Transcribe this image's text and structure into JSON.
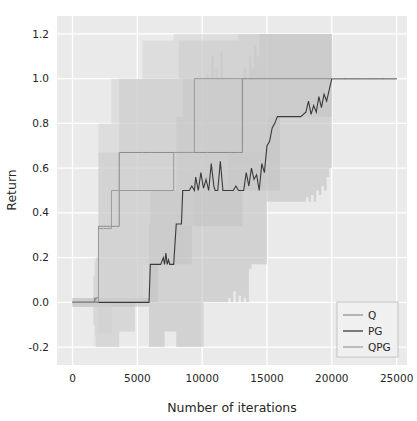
{
  "chart_data": {
    "type": "line",
    "title": "",
    "subtitle": "",
    "xlabel": "Number of iterations",
    "ylabel": "Return",
    "xlim": [
      -1200,
      25800
    ],
    "ylim": [
      -0.28,
      1.28
    ],
    "xticks": [
      0,
      5000,
      10000,
      15000,
      20000,
      25000
    ],
    "xtick_labels": [
      "0",
      "5000",
      "10000",
      "15000",
      "20000",
      "25000"
    ],
    "yticks": [
      -0.2,
      0.0,
      0.2,
      0.4,
      0.6,
      0.8,
      1.0,
      1.2
    ],
    "ytick_labels": [
      "-0.2",
      "0.0",
      "0.2",
      "0.4",
      "0.6",
      "0.8",
      "1.0",
      "1.2"
    ],
    "grid": true,
    "grid_color": "#ffffff",
    "plot_background": "#eaeaea",
    "legend_position": "lower right",
    "legend_entries": [
      "Q",
      "PG",
      "QPG"
    ],
    "series": [
      {
        "name": "Q",
        "color": "#8a8a8a",
        "linewidth": 1.0,
        "band_color": "#c6c6c6",
        "band_opacity": 0.55,
        "x": [
          0,
          1200,
          1600,
          1700,
          1750,
          1800,
          2000,
          2400,
          2600,
          2900,
          3200,
          3400,
          3600,
          4200,
          4800,
          5400,
          6000,
          6600,
          7200,
          7800,
          8200,
          8600,
          9200,
          9800,
          10400,
          11000,
          11600,
          12200,
          12800,
          13100,
          13400,
          14000,
          15000,
          16000,
          17000,
          18000,
          19000,
          20000,
          21000,
          22000,
          23000,
          24000,
          25000
        ],
        "y": [
          0.0,
          0.0,
          0.005,
          0.02,
          0.01,
          0.02,
          0.34,
          0.34,
          0.34,
          0.34,
          0.34,
          0.34,
          0.67,
          0.67,
          0.67,
          0.67,
          0.67,
          0.67,
          0.67,
          0.67,
          0.67,
          0.67,
          0.67,
          0.67,
          0.67,
          0.67,
          0.67,
          0.67,
          0.67,
          1.0,
          1.0,
          1.0,
          1.0,
          1.0,
          1.0,
          1.0,
          1.0,
          1.0,
          1.0,
          1.0,
          1.0,
          1.0,
          1.0
        ],
        "y_lower": [
          -0.02,
          -0.02,
          -0.1,
          -0.2,
          -0.15,
          -0.2,
          -0.2,
          -0.2,
          -0.2,
          -0.2,
          -0.2,
          -0.2,
          -0.13,
          -0.13,
          0.0,
          0.0,
          0.0,
          0.17,
          0.17,
          0.17,
          0.17,
          0.17,
          0.34,
          0.34,
          0.34,
          0.34,
          0.34,
          0.34,
          0.34,
          0.5,
          0.5,
          0.5,
          0.5,
          0.83,
          0.83,
          0.83,
          0.83,
          1.0
        ],
        "y_upper": [
          0.02,
          0.02,
          0.12,
          0.2,
          0.18,
          0.2,
          0.67,
          0.67,
          0.67,
          0.67,
          0.67,
          0.67,
          1.0,
          1.0,
          1.0,
          1.0,
          1.0,
          1.0,
          1.0,
          1.0,
          1.17,
          1.17,
          1.17,
          1.17,
          1.17,
          1.17,
          1.17,
          1.17,
          1.2,
          1.2,
          1.2,
          1.2,
          1.2,
          1.2,
          1.2,
          1.2,
          1.2,
          1.0
        ]
      },
      {
        "name": "PG",
        "color": "#3a3a3a",
        "linewidth": 1.1,
        "band_color": "#bdbdbd",
        "band_opacity": 0.55,
        "x": [
          0,
          1000,
          2000,
          3000,
          4000,
          5000,
          5900,
          6000,
          6400,
          6800,
          7000,
          7100,
          7200,
          7300,
          7400,
          7500,
          7600,
          7700,
          7800,
          8000,
          8200,
          8400,
          8500,
          8600,
          8800,
          9000,
          9200,
          9400,
          9500,
          9700,
          9900,
          10100,
          10300,
          10500,
          10700,
          10900,
          11000,
          11200,
          11400,
          11600,
          11800,
          12000,
          12200,
          12400,
          12600,
          12800,
          13000,
          13200,
          13400,
          13600,
          13800,
          14000,
          14200,
          14400,
          14600,
          14800,
          15000,
          15200,
          15400,
          15600,
          15800,
          16000,
          16400,
          17000,
          17600,
          18000,
          18200,
          18400,
          18600,
          18800,
          19000,
          19200,
          19400,
          19600,
          19800,
          20000,
          21000,
          22000,
          23000,
          24000,
          25000
        ],
        "y": [
          0.0,
          0.0,
          0.0,
          0.0,
          0.0,
          0.0,
          0.0,
          0.17,
          0.17,
          0.17,
          0.2,
          0.17,
          0.22,
          0.17,
          0.19,
          0.17,
          0.17,
          0.17,
          0.17,
          0.35,
          0.35,
          0.35,
          0.5,
          0.5,
          0.5,
          0.5,
          0.52,
          0.5,
          0.56,
          0.5,
          0.58,
          0.51,
          0.55,
          0.5,
          0.62,
          0.52,
          0.5,
          0.5,
          0.63,
          0.5,
          0.5,
          0.5,
          0.5,
          0.5,
          0.52,
          0.5,
          0.5,
          0.5,
          0.58,
          0.52,
          0.6,
          0.55,
          0.57,
          0.5,
          0.62,
          0.58,
          0.7,
          0.72,
          0.78,
          0.8,
          0.83,
          0.83,
          0.83,
          0.83,
          0.83,
          0.85,
          0.9,
          0.84,
          0.88,
          0.85,
          0.92,
          0.87,
          0.93,
          0.9,
          0.95,
          1.0,
          1.0,
          1.0,
          1.0,
          1.0,
          1.0
        ],
        "y_lower": [
          -0.02,
          -0.02,
          -0.02,
          -0.02,
          -0.02,
          -0.02,
          -0.2,
          -0.2,
          -0.2,
          -0.2,
          -0.2,
          -0.13,
          -0.13,
          -0.13,
          -0.13,
          -0.13,
          -0.13,
          -0.13,
          -0.13,
          -0.2,
          -0.2,
          -0.2,
          -0.2,
          -0.2,
          -0.2,
          -0.2,
          -0.2,
          -0.2,
          -0.2,
          -0.2,
          -0.2,
          0.0,
          0.0,
          0.0,
          0.0,
          0.0,
          0.0,
          0.0,
          0.0,
          0.0,
          0.0,
          0.02,
          0.0,
          0.05,
          0.0,
          0.03,
          0.0,
          0.02,
          0.0,
          0.15,
          0.17,
          0.17,
          0.17,
          0.17,
          0.17,
          0.17,
          0.45,
          0.45,
          0.45,
          0.45,
          0.45,
          0.45,
          0.45,
          0.45,
          0.45,
          0.47,
          0.45,
          0.48,
          0.45,
          0.5,
          0.48,
          0.52,
          0.5,
          0.56,
          0.6,
          1.0
        ],
        "y_upper": [
          0.02,
          0.02,
          0.02,
          0.02,
          0.02,
          0.02,
          0.35,
          0.5,
          0.5,
          0.5,
          0.5,
          0.5,
          0.5,
          0.5,
          0.5,
          0.5,
          0.5,
          0.5,
          0.5,
          0.83,
          0.83,
          0.83,
          1.0,
          1.0,
          1.0,
          1.0,
          1.0,
          1.0,
          1.0,
          1.0,
          1.0,
          1.0,
          1.02,
          1.0,
          1.1,
          1.0,
          1.05,
          1.0,
          1.12,
          1.0,
          1.0,
          1.0,
          1.0,
          1.0,
          1.0,
          1.0,
          1.0,
          1.05,
          1.0,
          1.1,
          1.05,
          1.15,
          1.1,
          1.2,
          1.2,
          1.2,
          1.2,
          1.2,
          1.2,
          1.2,
          1.2,
          1.2,
          1.2,
          1.2,
          1.2,
          1.2,
          1.2,
          1.2,
          1.2,
          1.2,
          1.2,
          1.2,
          1.2,
          1.2,
          1.2,
          1.0
        ]
      },
      {
        "name": "QPG",
        "color": "#9a9a9a",
        "linewidth": 1.0,
        "band_color": "#cfcfcf",
        "band_opacity": 0.5,
        "x": [
          0,
          1500,
          2000,
          2200,
          2400,
          2800,
          3000,
          3600,
          4200,
          4800,
          5400,
          6000,
          6600,
          7200,
          7800,
          8400,
          9000,
          9400,
          9600,
          10000,
          11000,
          12000,
          13000,
          14000,
          15000,
          16000,
          17000,
          18000,
          19000,
          20000,
          21000,
          22000,
          23000,
          24000,
          25000
        ],
        "y": [
          0.0,
          0.0,
          0.33,
          0.33,
          0.33,
          0.33,
          0.5,
          0.5,
          0.5,
          0.5,
          0.5,
          0.5,
          0.5,
          0.5,
          0.67,
          0.67,
          0.67,
          1.0,
          1.0,
          1.0,
          1.0,
          1.0,
          1.0,
          1.0,
          1.0,
          1.0,
          1.0,
          1.0,
          1.0,
          1.0,
          1.0,
          1.0,
          1.0,
          1.0,
          1.0
        ],
        "y_lower": [
          -0.02,
          -0.02,
          -0.14,
          -0.14,
          -0.14,
          -0.14,
          0.0,
          0.0,
          0.0,
          0.0,
          0.17,
          0.17,
          0.17,
          0.17,
          0.34,
          0.34,
          0.34,
          0.5,
          0.5,
          0.5,
          0.5,
          0.67,
          0.67,
          0.67,
          0.83,
          0.83,
          0.83,
          0.83,
          0.9,
          1.0
        ],
        "y_upper": [
          0.02,
          0.02,
          0.8,
          0.8,
          0.8,
          0.8,
          1.0,
          1.0,
          1.0,
          1.0,
          1.17,
          1.17,
          1.17,
          1.17,
          1.2,
          1.2,
          1.2,
          1.2,
          1.2,
          1.2,
          1.2,
          1.2,
          1.2,
          1.2,
          1.2,
          1.2,
          1.2,
          1.2,
          1.2,
          1.0
        ]
      }
    ]
  }
}
